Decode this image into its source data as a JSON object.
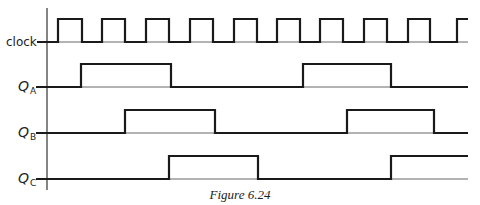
{
  "figure": {
    "caption": "Figure 6.24",
    "axis": {
      "x": 47,
      "y_top": 8,
      "y_bottom": 190
    },
    "x_end": 468,
    "signals": [
      {
        "id": "clock",
        "label": "clock",
        "label_main": "clock",
        "label_sub": "",
        "y_low": 42,
        "y_high": 19,
        "start_level": 0,
        "edges": [
          58,
          82,
          102,
          125,
          146,
          169,
          190,
          213,
          234,
          257,
          277,
          300,
          320,
          343,
          364,
          387,
          408,
          430,
          457
        ],
        "end_x": 468
      },
      {
        "id": "qa",
        "label": "QA",
        "label_main": "Q",
        "label_sub": "A",
        "y_low": 87,
        "y_high": 64,
        "start_level": 0,
        "edges": [
          81,
          171,
          303,
          391
        ],
        "end_x": 468
      },
      {
        "id": "qb",
        "label": "QB",
        "label_main": "Q",
        "label_sub": "B",
        "y_low": 133,
        "y_high": 110,
        "start_level": 0,
        "edges": [
          125,
          215,
          347,
          434
        ],
        "end_x": 468
      },
      {
        "id": "qc",
        "label": "QC",
        "label_main": "Q",
        "label_sub": "C",
        "y_low": 179,
        "y_high": 156,
        "start_level": 0,
        "edges": [
          169,
          258,
          391
        ],
        "end_x": 468
      }
    ]
  }
}
